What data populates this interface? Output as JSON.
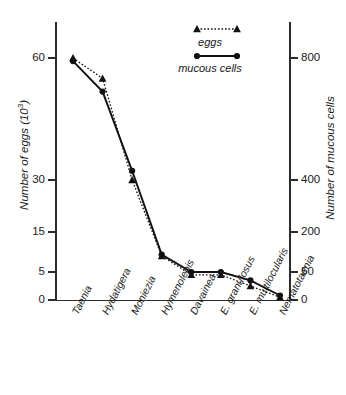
{
  "chart_data": {
    "type": "line",
    "title": "",
    "categories": [
      "Taenia",
      "Hydatigera",
      "Moniezia",
      "Hymenolepis",
      "Davainea",
      "E. granulosus",
      "E. multilocularis",
      "Nematotaenia"
    ],
    "series": [
      {
        "name": "eggs",
        "marker": "triangle",
        "linestyle": "dotted",
        "values": [
          60,
          55,
          30,
          9,
          4.5,
          4.5,
          2.5,
          0.5
        ]
      },
      {
        "name": "mucous cells",
        "marker": "circle",
        "linestyle": "solid",
        "values": [
          790,
          690,
          430,
          115,
          50,
          50,
          35,
          8
        ]
      }
    ],
    "xlabel": "",
    "ylabel_left": "Number of eggs (10",
    "ylabel_left_sup": "3",
    "ylabel_left_tail": ")",
    "ylabel_right": "Number of mucous cells",
    "yticks_left": [
      "0",
      "5",
      "15",
      "30",
      "60"
    ],
    "yticks_right": [
      "0",
      "50",
      "200",
      "400",
      "800"
    ],
    "ylim_left": [
      0,
      70
    ],
    "ylim_right": [
      0,
      1000
    ],
    "scale_note": "non-linear compressed ordinate",
    "grid": false,
    "legend_position": "top-center"
  },
  "legend": {
    "eggs_label": "eggs",
    "mucous_label": "mucous cells"
  },
  "colors": {
    "axis": "#2b2b2b",
    "eggs": "#111111",
    "mucous": "#111111",
    "background": "#ffffff"
  }
}
